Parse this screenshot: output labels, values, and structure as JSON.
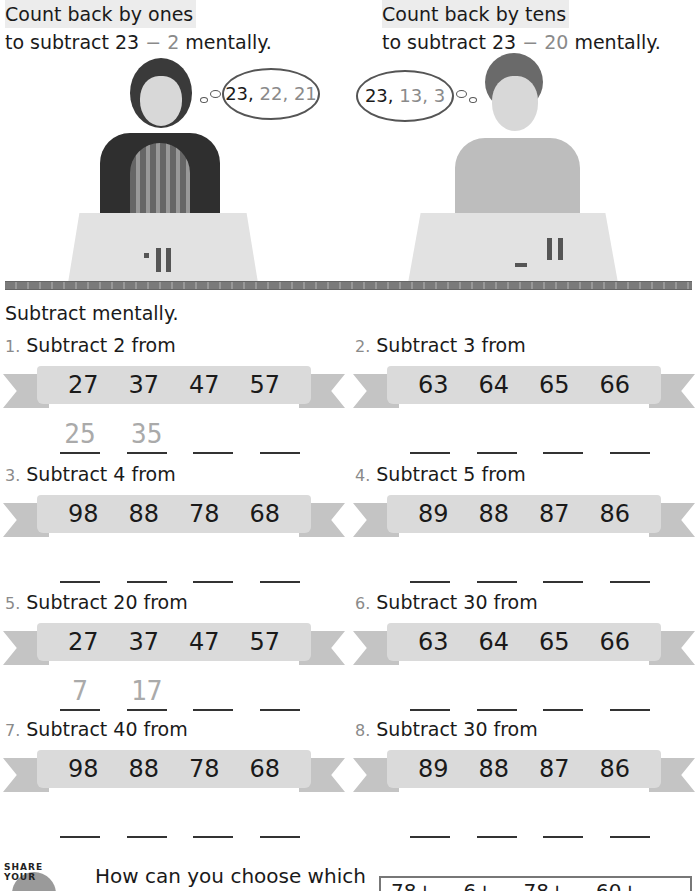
{
  "intro": {
    "left": {
      "heading": "Count back by ones",
      "line_prefix": "to subtract 23",
      "minus": "−",
      "operand": "2",
      "line_suffix": "mentally.",
      "thought_start": "23,",
      "thought_rest": "22, 21"
    },
    "right": {
      "heading": "Count back by tens",
      "line_prefix": "to subtract 23",
      "minus": "−",
      "operand": "20",
      "line_suffix": "mentally.",
      "thought_start": "23,",
      "thought_rest": "13, 3"
    }
  },
  "instruction": "Subtract mentally.",
  "problems": [
    {
      "num": "1.",
      "label": "Subtract 2 from",
      "values": [
        "27",
        "37",
        "47",
        "57"
      ],
      "answers": [
        "25",
        "35",
        "",
        ""
      ]
    },
    {
      "num": "2.",
      "label": "Subtract 3 from",
      "values": [
        "63",
        "64",
        "65",
        "66"
      ],
      "answers": [
        "",
        "",
        "",
        ""
      ]
    },
    {
      "num": "3.",
      "label": "Subtract 4 from",
      "values": [
        "98",
        "88",
        "78",
        "68"
      ],
      "answers": [
        "",
        "",
        "",
        ""
      ]
    },
    {
      "num": "4.",
      "label": "Subtract 5 from",
      "values": [
        "89",
        "88",
        "87",
        "86"
      ],
      "answers": [
        "",
        "",
        "",
        ""
      ]
    },
    {
      "num": "5.",
      "label": "Subtract 20 from",
      "values": [
        "27",
        "37",
        "47",
        "57"
      ],
      "answers": [
        "7",
        "17",
        "",
        ""
      ]
    },
    {
      "num": "6.",
      "label": "Subtract 30 from",
      "values": [
        "63",
        "64",
        "65",
        "66"
      ],
      "answers": [
        "",
        "",
        "",
        ""
      ]
    },
    {
      "num": "7.",
      "label": "Subtract 40 from",
      "values": [
        "98",
        "88",
        "78",
        "68"
      ],
      "answers": [
        "",
        "",
        "",
        ""
      ]
    },
    {
      "num": "8.",
      "label": "Subtract 30 from",
      "values": [
        "89",
        "88",
        "87",
        "86"
      ],
      "answers": [
        "",
        "",
        "",
        ""
      ]
    }
  ],
  "share": {
    "badge_text": "SHARE YOUR",
    "question": "How can you choose which",
    "box_text": "78+ 6+ 78+ 60+"
  }
}
